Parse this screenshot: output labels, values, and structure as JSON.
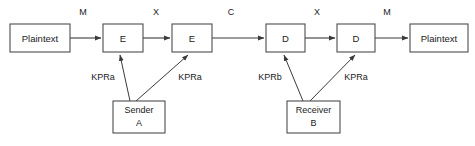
{
  "diagram": {
    "canvas": {
      "width": 475,
      "height": 146,
      "background": "#ffffff"
    },
    "stroke_color": "#3a3a3a",
    "box_border_color": "#4d4d4d",
    "box_fill": "#ffffff",
    "text_color": "#1a1a1a",
    "nodes": {
      "plaintext_in": {
        "label": "Plaintext",
        "x": 10,
        "y": 24,
        "w": 60,
        "h": 28
      },
      "encrypt_1": {
        "label": "E",
        "x": 103,
        "y": 24,
        "w": 40,
        "h": 28
      },
      "encrypt_2": {
        "label": "E",
        "x": 172,
        "y": 24,
        "w": 40,
        "h": 28
      },
      "decrypt_1": {
        "label": "D",
        "x": 266,
        "y": 24,
        "w": 39,
        "h": 28
      },
      "decrypt_2": {
        "label": "D",
        "x": 337,
        "y": 24,
        "w": 38,
        "h": 28
      },
      "plaintext_out": {
        "label": "Plaintext",
        "x": 410,
        "y": 24,
        "w": 58,
        "h": 28
      },
      "sender": {
        "label_line1": "Sender",
        "label_line2": "A",
        "x": 113,
        "y": 101,
        "w": 52,
        "h": 32
      },
      "receiver": {
        "label_line1": "Receiver",
        "label_line2": "B",
        "x": 287,
        "y": 101,
        "w": 53,
        "h": 32
      }
    },
    "signal_labels": [
      {
        "name": "signal-m-1",
        "text": "M",
        "x": 83,
        "y": 13
      },
      {
        "name": "signal-x-1",
        "text": "X",
        "x": 156,
        "y": 13
      },
      {
        "name": "signal-c",
        "text": "C",
        "x": 231,
        "y": 13
      },
      {
        "name": "signal-x-2",
        "text": "X",
        "x": 317,
        "y": 13
      },
      {
        "name": "signal-m-2",
        "text": "M",
        "x": 387,
        "y": 13
      }
    ],
    "key_labels": [
      {
        "name": "key-sender-left",
        "text": "KPRa",
        "x": 103,
        "y": 78
      },
      {
        "name": "key-sender-right",
        "text": "KPRa",
        "x": 190,
        "y": 78
      },
      {
        "name": "key-receiver-left",
        "text": "KPRb",
        "x": 270,
        "y": 78
      },
      {
        "name": "key-receiver-right",
        "text": "KPRa",
        "x": 356,
        "y": 78
      }
    ],
    "flow_arrows": [
      {
        "name": "arrow-plaintext-to-e1",
        "x1": 70,
        "y1": 38,
        "x2": 101,
        "y2": 38
      },
      {
        "name": "arrow-e1-to-e2",
        "x1": 143,
        "y1": 38,
        "x2": 170,
        "y2": 38
      },
      {
        "name": "arrow-e2-to-d1",
        "x1": 212,
        "y1": 38,
        "x2": 264,
        "y2": 38
      },
      {
        "name": "arrow-d1-to-d2",
        "x1": 305,
        "y1": 38,
        "x2": 335,
        "y2": 38
      },
      {
        "name": "arrow-d2-to-plaintext",
        "x1": 375,
        "y1": 38,
        "x2": 408,
        "y2": 38
      }
    ],
    "key_arrows": [
      {
        "name": "keyarrow-sender-to-e1",
        "x1": 130,
        "y1": 101,
        "x2": 120,
        "y2": 54
      },
      {
        "name": "keyarrow-sender-to-e2",
        "x1": 136,
        "y1": 101,
        "x2": 188,
        "y2": 54
      },
      {
        "name": "keyarrow-receiver-to-d1",
        "x1": 303,
        "y1": 101,
        "x2": 284,
        "y2": 54
      },
      {
        "name": "keyarrow-receiver-to-d2",
        "x1": 310,
        "y1": 101,
        "x2": 355,
        "y2": 54
      }
    ]
  }
}
